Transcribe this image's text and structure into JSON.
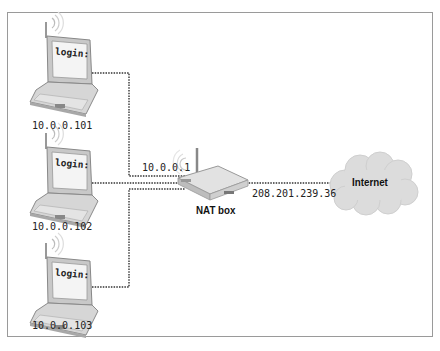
{
  "diagram": {
    "type": "network-nat",
    "clients": [
      {
        "ip": "10.0.0.101",
        "screen_text": "login:"
      },
      {
        "ip": "10.0.0.102",
        "screen_text": "login:"
      },
      {
        "ip": "10.0.0.103",
        "screen_text": "login:"
      }
    ],
    "router": {
      "label": "NAT box",
      "internal_ip": "10.0.0.1",
      "external_ip": "208.201.239.36"
    },
    "cloud": {
      "label": "Internet"
    },
    "colors": {
      "frame": "#9a9a9a",
      "link": "#333333",
      "device_fill": "#d9d9d9",
      "screen_fill": "#f2f2f2",
      "cloud_fill": "#dcdcdc"
    }
  }
}
